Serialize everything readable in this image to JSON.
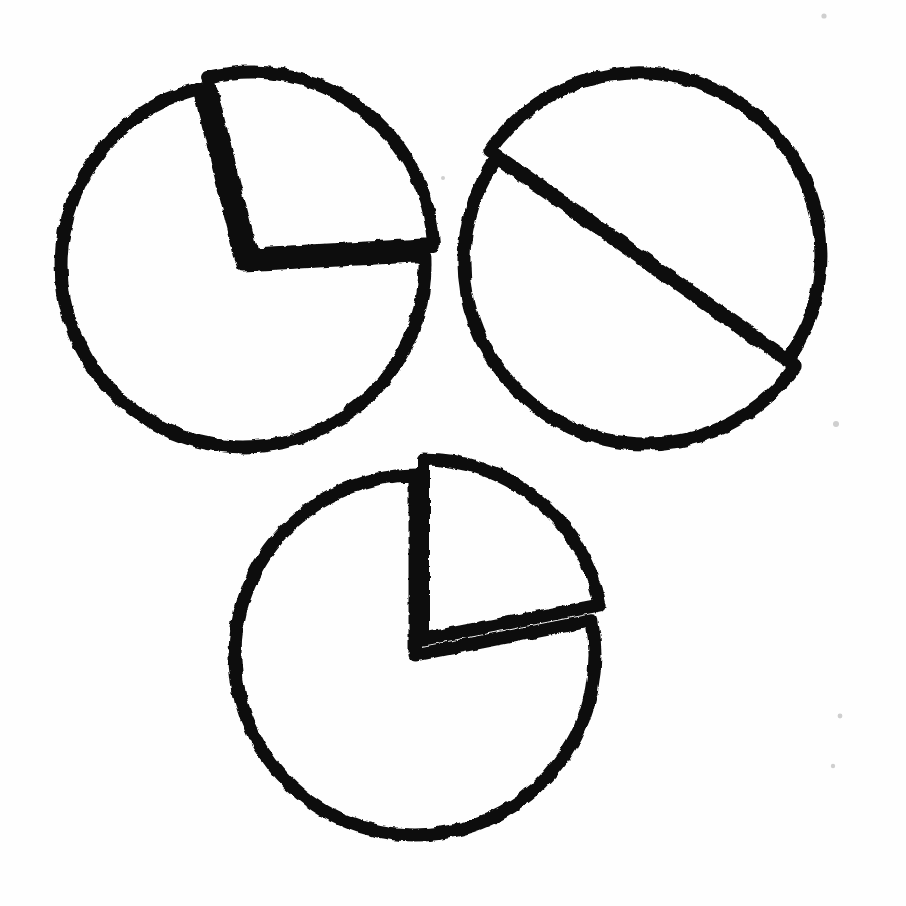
{
  "figure": {
    "medium": "black ink sketch on white paper",
    "background_color": "#fefefe",
    "ink_color": "#111111",
    "canvas": {
      "width": 906,
      "height": 906
    }
  },
  "chart_data": [
    {
      "type": "pie",
      "name": "pie-chart-top-left",
      "title": "",
      "center": [
        243,
        265
      ],
      "radius": 182,
      "exploded": true,
      "exploded_slice_index": 0,
      "explode_offset": 14,
      "explode_direction_deg": -52,
      "categories": [
        "Slice A",
        "Slice B"
      ],
      "values": [
        28,
        72
      ],
      "start_angle_deg": -104,
      "slice_angles_deg": [
        101,
        259
      ],
      "labels_shown": false,
      "legend": "none",
      "grid": false
    },
    {
      "type": "pie",
      "name": "pie-chart-top-right",
      "title": "",
      "center": [
        646,
        262
      ],
      "radius": 182,
      "exploded": true,
      "exploded_slice_index": 0,
      "explode_offset": 10,
      "explode_direction_deg": -135,
      "categories": [
        "Slice A",
        "Slice B"
      ],
      "values": [
        50,
        50
      ],
      "start_angle_deg": -145,
      "slice_angles_deg": [
        180,
        180
      ],
      "labels_shown": false,
      "legend": "none",
      "grid": false
    },
    {
      "type": "pie",
      "name": "pie-chart-bottom",
      "title": "",
      "center": [
        415,
        655
      ],
      "radius": 180,
      "exploded": true,
      "exploded_slice_index": 0,
      "explode_offset": 18,
      "explode_direction_deg": -62,
      "categories": [
        "Slice A",
        "Slice B"
      ],
      "values": [
        22,
        78
      ],
      "start_angle_deg": -90,
      "slice_angles_deg": [
        79,
        281
      ],
      "labels_shown": false,
      "legend": "none",
      "grid": false
    }
  ],
  "annotations": {
    "speck_count": 5,
    "notes": "No text, axes, tick labels, legend or numerals appear anywhere in the image."
  }
}
